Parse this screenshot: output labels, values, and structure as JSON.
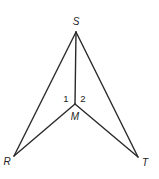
{
  "diagram": {
    "type": "geometry-figure",
    "vertices": {
      "S": {
        "label": "S",
        "x": 76,
        "y": 32,
        "label_x": 76,
        "label_y": 25
      },
      "M": {
        "label": "M",
        "x": 75,
        "y": 104,
        "label_x": 75,
        "label_y": 120
      },
      "R": {
        "label": "R",
        "x": 14,
        "y": 156,
        "label_x": 7,
        "label_y": 165
      },
      "T": {
        "label": "T",
        "x": 138,
        "y": 157,
        "label_x": 145,
        "label_y": 166
      }
    },
    "segments": [
      {
        "from": "S",
        "to": "R"
      },
      {
        "from": "S",
        "to": "T"
      },
      {
        "from": "S",
        "to": "M"
      },
      {
        "from": "M",
        "to": "R"
      },
      {
        "from": "M",
        "to": "T"
      }
    ],
    "angles": [
      {
        "label": "1",
        "x": 66,
        "y": 102
      },
      {
        "label": "2",
        "x": 83,
        "y": 102
      }
    ],
    "colors": {
      "stroke": "#2a2a2a",
      "text": "#222222",
      "background": "#ffffff"
    }
  }
}
